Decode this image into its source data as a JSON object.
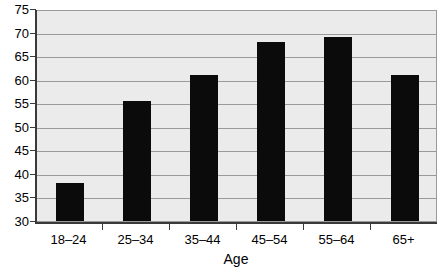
{
  "chart_data": {
    "type": "bar",
    "title": "",
    "subtitle": "",
    "xlabel": "Age",
    "ylabel": "",
    "categories": [
      "18–24",
      "25–34",
      "35–44",
      "45–54",
      "55–64",
      "65+"
    ],
    "values": [
      38,
      55.5,
      61,
      68,
      69,
      61
    ],
    "ylim": [
      30,
      75
    ],
    "ytick_step": 5,
    "yticks": [
      30,
      35,
      40,
      45,
      50,
      55,
      60,
      65,
      70,
      75
    ],
    "ytick_labels": [
      "30",
      "35",
      "40",
      "45",
      "50",
      "55",
      "60",
      "65",
      "70",
      "75"
    ],
    "grid": true,
    "grid_axis": "y",
    "legend": false,
    "legend_position": "none",
    "annotations": [],
    "colors": {
      "bar": "#0b0b0b",
      "plot_background": "#ebebeb",
      "gridline": "#9a9a9a",
      "axis": "#3a3a3a",
      "page_background": "#ffffff",
      "text": "#000000"
    }
  }
}
